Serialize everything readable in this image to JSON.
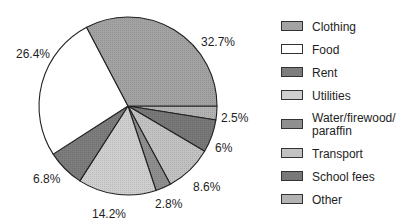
{
  "chart_data": {
    "type": "pie",
    "title": "",
    "start_angle_deg": 0,
    "direction": "clockwise-from-3-oclock (Clothing drawn counter-clockwise from 3 o'clock)",
    "slices": [
      {
        "label": "Clothing",
        "value": 32.7,
        "display": "32.7%",
        "color": "#a3a3a3"
      },
      {
        "label": "Food",
        "value": 26.4,
        "display": "26.4%",
        "color": "#ffffff"
      },
      {
        "label": "Rent",
        "value": 6.8,
        "display": "6.8%",
        "color": "#7d7d7d"
      },
      {
        "label": "Utilities",
        "value": 14.2,
        "display": "14.2%",
        "color": "#cfcfcf"
      },
      {
        "label": "Water/firewood/ paraffin",
        "value": 2.8,
        "display": "2.8%",
        "color": "#8f8f8f"
      },
      {
        "label": "Transport",
        "value": 8.6,
        "display": "8.6%",
        "color": "#c2c2c2"
      },
      {
        "label": "School fees",
        "value": 6.0,
        "display": "6%",
        "color": "#787878"
      },
      {
        "label": "Other",
        "value": 2.5,
        "display": "2.5%",
        "color": "#b3b3b3"
      }
    ],
    "legend_position": "right"
  },
  "legend": {
    "items": [
      {
        "label": "Clothing",
        "color": "#a3a3a3"
      },
      {
        "label": "Food",
        "color": "#ffffff"
      },
      {
        "label": "Rent",
        "color": "#7d7d7d"
      },
      {
        "label": "Utilities",
        "color": "#cfcfcf"
      },
      {
        "label": "Water/firewood/ paraffin",
        "color": "#8f8f8f"
      },
      {
        "label": "Transport",
        "color": "#c2c2c2"
      },
      {
        "label": "School fees",
        "color": "#787878"
      },
      {
        "label": "Other",
        "color": "#b3b3b3"
      }
    ]
  },
  "labels": {
    "clothing": "32.7%",
    "food": "26.4%",
    "other": "2.5%",
    "school_fees": "6%",
    "transport": "8.6%",
    "water": "2.8%",
    "utilities": "14.2%",
    "rent": "6.8%"
  }
}
